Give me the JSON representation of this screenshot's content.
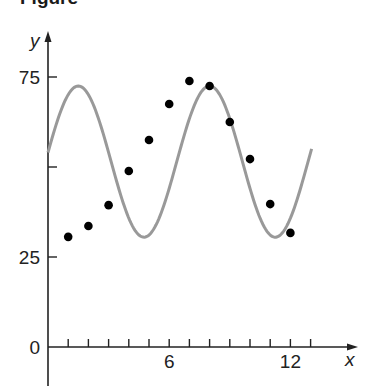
{
  "figure": {
    "title": "Figure"
  },
  "chart_data": {
    "type": "scatter",
    "title": "",
    "xlabel": "x",
    "ylabel": "y",
    "xlim": [
      0,
      13.5
    ],
    "ylim": [
      0,
      85
    ],
    "grid": false,
    "x_ticks": [
      1,
      2,
      3,
      4,
      5,
      6,
      7,
      8,
      9,
      10,
      11,
      12,
      13
    ],
    "x_tick_labels": [
      {
        "value": 6,
        "label": "6"
      },
      {
        "value": 12,
        "label": "12"
      }
    ],
    "y_ticks": [
      25,
      50,
      75
    ],
    "y_tick_labels": [
      {
        "value": 0,
        "label": "0"
      },
      {
        "value": 25,
        "label": "25"
      },
      {
        "value": 75,
        "label": "75"
      }
    ],
    "series": [
      {
        "name": "data points",
        "kind": "scatter",
        "color": "#000000",
        "x": [
          1,
          2,
          3,
          4,
          5,
          6,
          7,
          8,
          9,
          10,
          11,
          12
        ],
        "y": [
          30.6,
          33.6,
          39.4,
          48.9,
          57.5,
          67.5,
          73.9,
          72.5,
          62.5,
          52.2,
          39.7,
          31.7
        ]
      },
      {
        "name": "sinusoidal fit",
        "kind": "line",
        "color": "#999999",
        "function": "y = 51.5 + 21 cos(2π(x − 1.5)/6.5)",
        "amplitude": 21,
        "midline": 51.5,
        "period": 6.5,
        "peak_x": 1.5,
        "x_range": [
          0,
          13.05
        ]
      }
    ]
  }
}
